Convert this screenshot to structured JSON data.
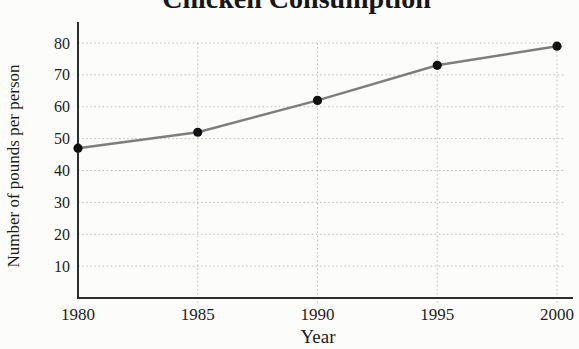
{
  "chart_data": {
    "type": "line",
    "title": "Chicken Consumption",
    "xlabel": "Year",
    "ylabel": "Number of pounds per person",
    "x": [
      1980,
      1985,
      1990,
      1995,
      2000
    ],
    "values": [
      47,
      52,
      62,
      73,
      79
    ],
    "series": [
      {
        "name": "pounds per person",
        "values": [
          47,
          52,
          62,
          73,
          79
        ]
      }
    ],
    "xticks": [
      1980,
      1985,
      1990,
      1995,
      2000
    ],
    "yticks": [
      10,
      20,
      30,
      40,
      50,
      60,
      70,
      80
    ],
    "xlim": [
      1980,
      2000
    ],
    "ylim": [
      0,
      85
    ],
    "grid": true,
    "grid_style": "dotted",
    "legend_position": "none",
    "colors": {
      "line": "#7e7e7e",
      "marker": "#111111",
      "grid": "#bcbcbc",
      "axis": "#2e2e2e",
      "text": "#1c1c1c"
    }
  }
}
